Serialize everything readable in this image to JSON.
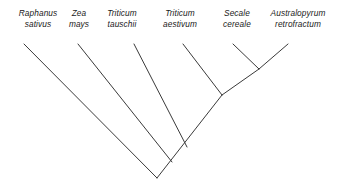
{
  "figure": {
    "kind": "cladogram",
    "orientation": "tips-top-root-bottom",
    "line_color": "#3a3a3a",
    "background_color": "#ffffff",
    "text_color": "#1a1a1a"
  },
  "taxa": [
    {
      "id": "raphanus-sativus",
      "genus": "Raphanus",
      "species": "sativus",
      "label_x": 38,
      "label_y": 8,
      "tip_x": 24,
      "tip_y": 44
    },
    {
      "id": "zea-mays",
      "genus": "Zea",
      "species": "mays",
      "label_x": 79,
      "label_y": 8,
      "tip_x": 78,
      "tip_y": 44
    },
    {
      "id": "triticum-tauschii",
      "genus": "Triticum",
      "species": "tauschii",
      "label_x": 122,
      "label_y": 8,
      "tip_x": 134,
      "tip_y": 44
    },
    {
      "id": "triticum-aestivum",
      "genus": "Triticum",
      "species": "aestivum",
      "label_x": 180,
      "label_y": 8,
      "tip_x": 183,
      "tip_y": 44
    },
    {
      "id": "secale-cereale",
      "genus": "Secale",
      "species": "cereale",
      "label_x": 237,
      "label_y": 8,
      "tip_x": 233,
      "tip_y": 44
    },
    {
      "id": "australopyrum-retrofractum",
      "genus": "Australopyrum",
      "species": "retrofractum",
      "label_x": 298,
      "label_y": 8,
      "tip_x": 288,
      "tip_y": 44
    }
  ],
  "nodes": [
    {
      "id": "node-secale-australopyrum",
      "x": 259,
      "y": 69,
      "children": [
        "secale-cereale",
        "australopyrum-retrofractum"
      ]
    },
    {
      "id": "node-aestivum-clade",
      "x": 222,
      "y": 95,
      "children": [
        "triticum-aestivum",
        "node-secale-australopyrum"
      ]
    },
    {
      "id": "node-tauschii-clade",
      "x": 187,
      "y": 147,
      "children": [
        "triticum-tauschii",
        "node-aestivum-clade"
      ]
    },
    {
      "id": "node-zea-clade",
      "x": 172,
      "y": 162,
      "children": [
        "zea-mays",
        "node-tauschii-clade"
      ]
    },
    {
      "id": "node-root",
      "x": 157,
      "y": 178,
      "children": [
        "raphanus-sativus",
        "node-zea-clade"
      ]
    }
  ],
  "branches": [
    {
      "id": "branch-raphanus",
      "name": "branch-raphanus-sativus",
      "x1": 24,
      "y1": 44,
      "x2": 157,
      "y2": 178
    },
    {
      "id": "branch-zea",
      "name": "branch-zea-mays",
      "x1": 78,
      "y1": 44,
      "x2": 172,
      "y2": 162
    },
    {
      "id": "branch-tauschii",
      "name": "branch-triticum-tauschii",
      "x1": 134,
      "y1": 44,
      "x2": 187,
      "y2": 147
    },
    {
      "id": "branch-aestivum",
      "name": "branch-triticum-aestivum",
      "x1": 183,
      "y1": 44,
      "x2": 222,
      "y2": 95
    },
    {
      "id": "branch-secale",
      "name": "branch-secale-cereale",
      "x1": 233,
      "y1": 44,
      "x2": 259,
      "y2": 69
    },
    {
      "id": "branch-australopyrum",
      "name": "branch-australopyrum-retrofractum",
      "x1": 288,
      "y1": 44,
      "x2": 259,
      "y2": 69
    },
    {
      "id": "branch-internal-1",
      "name": "branch-internal-secale-clade",
      "x1": 259,
      "y1": 69,
      "x2": 222,
      "y2": 95
    },
    {
      "id": "branch-internal-2",
      "name": "branch-internal-aestivum-clade",
      "x1": 222,
      "y1": 95,
      "x2": 157,
      "y2": 178
    }
  ]
}
